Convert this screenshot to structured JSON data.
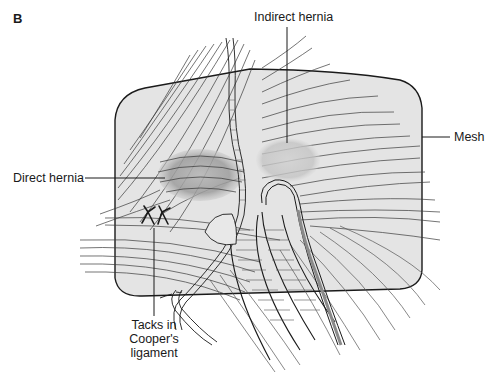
{
  "figure": {
    "panel_label": "B",
    "labels": {
      "indirect_hernia": "Indirect hernia",
      "mesh": "Mesh",
      "direct_hernia": "Direct hernia",
      "tacks_line1": "Tacks in",
      "tacks_line2": "Cooper's",
      "tacks_line3": "ligament"
    },
    "colors": {
      "ink": "#1a1a1a",
      "mesh_fill": "#e4e4e4",
      "hernia_shade": "#9a9a9a",
      "background": "#ffffff"
    }
  }
}
